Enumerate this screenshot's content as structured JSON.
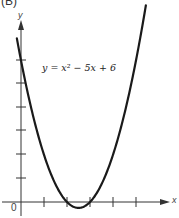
{
  "panel_label": "(B)",
  "equation": "y = x² − 5x + 6",
  "axes": {
    "x_label": "x",
    "y_label": "y",
    "origin_label": "0"
  },
  "colors": {
    "curve": "#1a1a1a",
    "axes": "#333333",
    "background": "#ffffff"
  },
  "chart_data": {
    "type": "line",
    "title": "",
    "annotation": "y = x² − 5x + 6",
    "xlabel": "x",
    "ylabel": "y",
    "xlim": [
      -0.9,
      6.8
    ],
    "ylim": [
      -0.9,
      8.3
    ],
    "x_ticks": [
      1,
      2,
      3,
      4,
      5
    ],
    "y_ticks": [
      1,
      2,
      3,
      4,
      5,
      6
    ],
    "tick_labels_shown": false,
    "grid": false,
    "legend": null,
    "series": [
      {
        "name": "y = x² − 5x + 6",
        "x": [
          -0.2,
          0,
          0.5,
          1,
          1.5,
          2,
          2.5,
          3,
          3.5,
          4,
          4.5,
          5,
          5.5
        ],
        "values": [
          7.04,
          6,
          3.75,
          2,
          0.75,
          0,
          -0.25,
          0,
          0.75,
          2,
          3.75,
          6,
          8.75
        ]
      }
    ],
    "roots": [
      2,
      3
    ],
    "vertex": [
      2.5,
      -0.25
    ]
  }
}
